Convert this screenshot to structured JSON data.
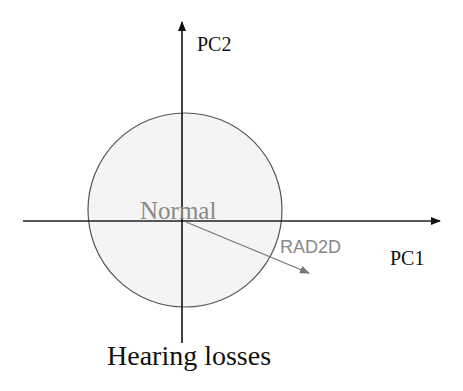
{
  "diagram": {
    "type": "pca-biplot-schematic",
    "axes": {
      "x_label": "PC1",
      "y_label": "PC2"
    },
    "region": {
      "label": "Normal",
      "fill_color": "#f4f4f4",
      "stroke_color": "#555555"
    },
    "vector": {
      "label": "RAD2D",
      "color": "#777777"
    },
    "bottom_label": "Hearing losses",
    "colors": {
      "axis": "#111111",
      "text": "#111111",
      "muted_text": "#888888"
    }
  }
}
